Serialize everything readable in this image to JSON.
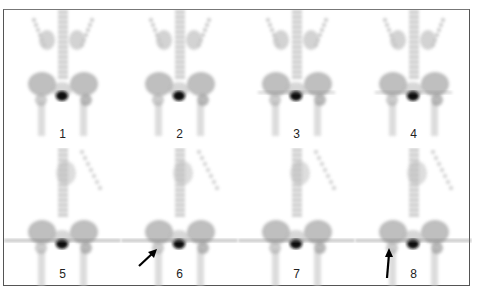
{
  "figure": {
    "panels": [
      {
        "label": "1",
        "row": 0,
        "col": 0,
        "arrow": null,
        "band": false
      },
      {
        "label": "2",
        "row": 0,
        "col": 1,
        "arrow": null,
        "band": false
      },
      {
        "label": "3",
        "row": 0,
        "col": 2,
        "arrow": null,
        "band": true
      },
      {
        "label": "4",
        "row": 0,
        "col": 3,
        "arrow": null,
        "band": true
      },
      {
        "label": "5",
        "row": 1,
        "col": 0,
        "arrow": null,
        "band": true
      },
      {
        "label": "6",
        "row": 1,
        "col": 1,
        "arrow": "diagonal",
        "band": true
      },
      {
        "label": "7",
        "row": 1,
        "col": 2,
        "arrow": null,
        "band": true
      },
      {
        "label": "8",
        "row": 1,
        "col": 3,
        "arrow": "vertical",
        "band": true
      }
    ]
  }
}
